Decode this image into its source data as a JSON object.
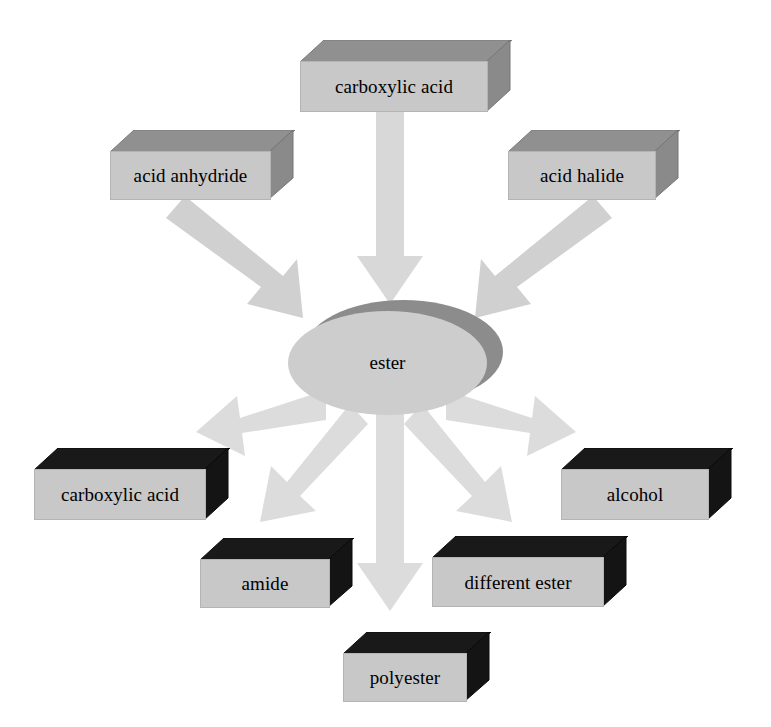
{
  "diagram": {
    "center": {
      "id": "ester",
      "label": "ester",
      "shape": "ellipse",
      "fill": "#cdcdcd",
      "shadow": "#8c8c8c"
    },
    "inputs": [
      {
        "id": "carboxylic-acid-in",
        "label": "carboxylic acid",
        "position": "top-center",
        "fill": "#c8c8c8",
        "top_face": "#909090",
        "side_face": "#8a8a8a"
      },
      {
        "id": "acid-anhydride",
        "label": "acid anhydride",
        "position": "top-left",
        "fill": "#c8c8c8",
        "top_face": "#909090",
        "side_face": "#8a8a8a"
      },
      {
        "id": "acid-halide",
        "label": "acid halide",
        "position": "top-right",
        "fill": "#c8c8c8",
        "top_face": "#909090",
        "side_face": "#8a8a8a"
      }
    ],
    "outputs": [
      {
        "id": "carboxylic-acid-out",
        "label": "carboxylic acid",
        "position": "bottom-left",
        "fill": "#c2c2c2",
        "top_face": "#191919",
        "side_face": "#141414"
      },
      {
        "id": "amide",
        "label": "amide",
        "position": "bottom-left-inner",
        "fill": "#c2c2c2",
        "top_face": "#191919",
        "side_face": "#141414"
      },
      {
        "id": "polyester",
        "label": "polyester",
        "position": "bottom-center",
        "fill": "#c2c2c2",
        "top_face": "#191919",
        "side_face": "#141414"
      },
      {
        "id": "different-ester",
        "label": "different ester",
        "position": "bottom-right-inner",
        "fill": "#c2c2c2",
        "top_face": "#191919",
        "side_face": "#141414"
      },
      {
        "id": "alcohol",
        "label": "alcohol",
        "position": "bottom-right",
        "fill": "#c2c2c2",
        "top_face": "#191919",
        "side_face": "#141414"
      }
    ],
    "arrows": [
      {
        "id": "arrow-carboxylic-acid-to-ester",
        "from": "carboxylic acid",
        "to": "ester",
        "direction": "down",
        "color": "#d8d8d8"
      },
      {
        "id": "arrow-acid-anhydride-to-ester",
        "from": "acid anhydride",
        "to": "ester",
        "direction": "down-right",
        "color": "#d0d0d0"
      },
      {
        "id": "arrow-acid-halide-to-ester",
        "from": "acid halide",
        "to": "ester",
        "direction": "down-left",
        "color": "#d0d0d0"
      },
      {
        "id": "arrow-ester-to-carboxylic-acid",
        "from": "ester",
        "to": "carboxylic acid",
        "direction": "left",
        "color": "#dcdcdc"
      },
      {
        "id": "arrow-ester-to-amide",
        "from": "ester",
        "to": "amide",
        "direction": "down-left",
        "color": "#dcdcdc"
      },
      {
        "id": "arrow-ester-to-polyester",
        "from": "ester",
        "to": "polyester",
        "direction": "down",
        "color": "#dcdcdc"
      },
      {
        "id": "arrow-ester-to-different-ester",
        "from": "ester",
        "to": "different ester",
        "direction": "down-right",
        "color": "#dcdcdc"
      },
      {
        "id": "arrow-ester-to-alcohol",
        "from": "ester",
        "to": "alcohol",
        "direction": "right",
        "color": "#dcdcdc"
      }
    ]
  }
}
